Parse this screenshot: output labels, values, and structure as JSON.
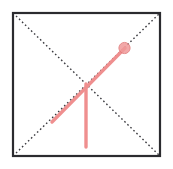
{
  "figure": {
    "width": 173,
    "height": 169,
    "background_color": "#ffffff"
  },
  "colors": {
    "frame_stroke": "#2b2b2f",
    "diagonal_dotted": "#3a3a3f",
    "highlight_red": "#ef8f8f",
    "highlight_red_strong": "#e06a6a",
    "marker_fill": "#f09a9a",
    "marker_stroke": "#e07878"
  },
  "chart_data": {
    "type": "scatter",
    "xlabel": "",
    "ylabel": "",
    "xlim": [
      13,
      160
    ],
    "ylim": [
      13,
      156
    ],
    "grid": false,
    "legend": null,
    "tick_labels": {
      "x": [],
      "y": []
    },
    "shapes": [
      {
        "name": "outer-square",
        "kind": "rect",
        "x": 13,
        "y": 13,
        "width": 147,
        "height": 143,
        "stroke": "#2b2b2f",
        "stroke_width": 2.2,
        "fill": "none",
        "dash": "solid"
      },
      {
        "name": "diagonal-tl-br",
        "kind": "line",
        "x1": 13,
        "y1": 13,
        "x2": 160,
        "y2": 156,
        "stroke": "#3a3a3f",
        "stroke_width": 1.4,
        "dash": "dotted"
      },
      {
        "name": "diagonal-bl-tr",
        "kind": "line",
        "x1": 13,
        "y1": 156,
        "x2": 160,
        "y2": 13,
        "stroke": "#3a3a3f",
        "stroke_width": 1.4,
        "dash": "dotted"
      },
      {
        "name": "highlight-diagonal-segment",
        "kind": "line",
        "x1": 52,
        "y1": 122,
        "x2": 125,
        "y2": 48,
        "stroke": "#ef8f8f",
        "stroke_width": 3.4,
        "dash": "solid"
      },
      {
        "name": "highlight-vertical-segment",
        "kind": "line",
        "x1": 86,
        "y1": 84,
        "x2": 86,
        "y2": 147,
        "stroke": "#ef8f8f",
        "stroke_width": 3.4,
        "dash": "solid"
      }
    ],
    "points": [
      {
        "name": "marker-endpoint",
        "x": 124.5,
        "y": 48,
        "radius": 5.6,
        "fill": "#f09a9a",
        "stroke": "#e07878",
        "opacity": 0.85
      },
      {
        "name": "center-intersection",
        "x": 86.5,
        "y": 84.5,
        "radius": 0,
        "fill": "none",
        "stroke": "none",
        "opacity": 0
      }
    ],
    "annotations": []
  }
}
